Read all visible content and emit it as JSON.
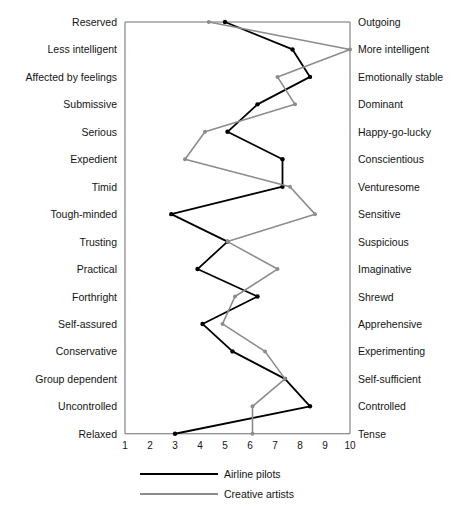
{
  "chart_data": {
    "type": "line",
    "title": "",
    "subtitle": "",
    "xlabel": "",
    "ylabel": "",
    "orientation": "horizontal-profile",
    "xlim": [
      1,
      10
    ],
    "xticks": [
      1,
      2,
      3,
      4,
      5,
      6,
      7,
      8,
      9,
      10
    ],
    "xtick_labels": [
      "1",
      "2",
      "3",
      "4",
      "5",
      "6",
      "7",
      "8",
      "9",
      "10"
    ],
    "grid": false,
    "legend_position": "bottom",
    "categories": [
      "Reserved",
      "Less intelligent",
      "Affected by feelings",
      "Submissive",
      "Serious",
      "Expedient",
      "Timid",
      "Tough-minded",
      "Trusting",
      "Practical",
      "Forthright",
      "Self-assured",
      "Conservative",
      "Group dependent",
      "Uncontrolled",
      "Relaxed"
    ],
    "categories_right": [
      "Outgoing",
      "More intelligent",
      "Emotionally stable",
      "Dominant",
      "Happy-go-lucky",
      "Conscientious",
      "Venturesome",
      "Sensitive",
      "Suspicious",
      "Imaginative",
      "Shrewd",
      "Apprehensive",
      "Experimenting",
      "Self-sufficient",
      "Controlled",
      "Tense"
    ],
    "series": [
      {
        "name": "Airline pilots",
        "color": "#000000",
        "values": [
          5.0,
          7.7,
          8.4,
          6.3,
          5.1,
          7.3,
          7.3,
          2.85,
          5.1,
          3.9,
          6.3,
          4.1,
          5.3,
          7.4,
          8.4,
          3.0
        ]
      },
      {
        "name": "Creative artists",
        "color": "#8c8c8c",
        "values": [
          4.35,
          10.0,
          7.1,
          7.8,
          4.2,
          3.4,
          7.6,
          8.6,
          5.1,
          7.1,
          5.4,
          4.9,
          6.6,
          7.4,
          6.1,
          6.1
        ]
      }
    ]
  }
}
